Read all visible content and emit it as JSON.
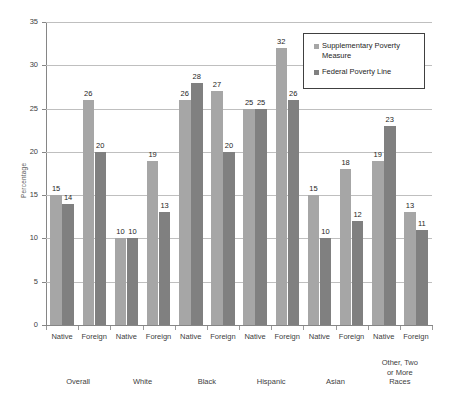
{
  "chart_data": {
    "type": "bar",
    "title": "",
    "xlabel": "",
    "ylabel": "Percentage",
    "ylim": [
      0,
      35
    ],
    "ytick_step": 5,
    "yticks": [
      "0",
      "5",
      "10",
      "15",
      "20",
      "25",
      "30",
      "35"
    ],
    "grid": true,
    "legend_position": "top-right",
    "colors": {
      "supplementary_poverty_measure": "#a6a6a6",
      "federal_poverty_line": "#808080",
      "gridline": "#bfbfbf",
      "axis": "#868686",
      "text": "#404040"
    },
    "legend": [
      "Supplementary Poverty Measure",
      "Federal Poverty Line"
    ],
    "series": [
      {
        "name": "Supplementary Poverty Measure",
        "values": [
          15,
          26,
          10,
          19,
          26,
          27,
          25,
          32,
          15,
          18,
          19,
          13
        ]
      },
      {
        "name": "Federal Poverty Line",
        "values": [
          14,
          20,
          10,
          13,
          28,
          20,
          25,
          26,
          10,
          12,
          23,
          11
        ]
      }
    ],
    "categories": [
      "Native",
      "Foreign",
      "Native",
      "Foreign",
      "Native",
      "Foreign",
      "Native",
      "Foreign",
      "Native",
      "Foreign",
      "Native",
      "Foreign"
    ],
    "groups": [
      {
        "label": "Overall",
        "lines": [
          "Overall"
        ]
      },
      {
        "label": "White",
        "lines": [
          "White"
        ]
      },
      {
        "label": "Black",
        "lines": [
          "Black"
        ]
      },
      {
        "label": "Hispanic",
        "lines": [
          "Hispanic"
        ]
      },
      {
        "label": "Asian",
        "lines": [
          "Asian"
        ]
      },
      {
        "label": "Other, Two or More Races",
        "lines": [
          "Other, Two",
          "or More",
          "Races"
        ]
      }
    ]
  }
}
